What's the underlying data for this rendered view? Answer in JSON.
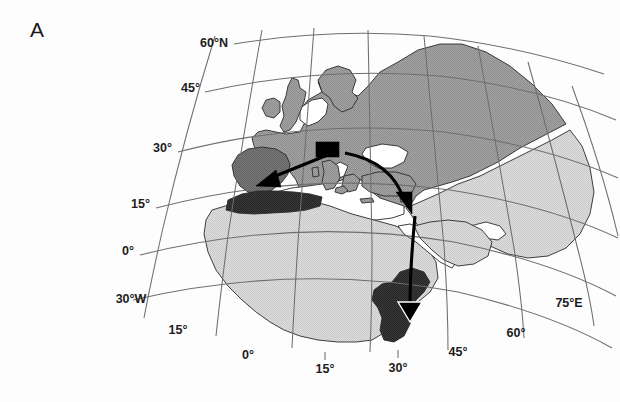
{
  "figure": {
    "panel_label": "A",
    "type": "map",
    "projection": "conic",
    "background_color": "#fdfdfd"
  },
  "colors": {
    "land_light": "#d6d6d6",
    "land_mid": "#9b9b9b",
    "land_highlight": "#6f6f6f",
    "land_dark": "#333333",
    "ocean": "#ffffff",
    "coastline": "#2a2a2a",
    "graticule": "#6e6e6e",
    "arrow": "#000000",
    "source_marker": "#000000",
    "text": "#1c1c1c"
  },
  "graticule": {
    "latitude_labels": [
      {
        "text": "60°N",
        "x": 228,
        "y": 47
      },
      {
        "text": "45°",
        "x": 196,
        "y": 92
      },
      {
        "text": "30°",
        "x": 160,
        "y": 152
      },
      {
        "text": "15°",
        "x": 135,
        "y": 208
      },
      {
        "text": "0°",
        "x": 119,
        "y": 253
      }
    ],
    "longitude_labels": [
      {
        "text": "30°W",
        "x": 120,
        "y": 299
      },
      {
        "text": "15°",
        "x": 172,
        "y": 330
      },
      {
        "text": "0°",
        "x": 245,
        "y": 355
      },
      {
        "text": "15°",
        "x": 318,
        "y": 369
      },
      {
        "text": "30°",
        "x": 392,
        "y": 368
      },
      {
        "text": "45°",
        "x": 455,
        "y": 352
      },
      {
        "text": "60°",
        "x": 513,
        "y": 333
      },
      {
        "text": "75°E",
        "x": 562,
        "y": 303
      }
    ]
  },
  "regions": [
    {
      "name": "eurasia-north",
      "shade": "land_mid",
      "description": "Northern Europe and western Russia, medium gray fill"
    },
    {
      "name": "asia-south",
      "shade": "land_light",
      "description": "Arabia, Iran, South Asia, light gray fill"
    },
    {
      "name": "africa",
      "shade": "land_light",
      "description": "African continent, light gray fill"
    },
    {
      "name": "iberia-highlight",
      "shade": "land_highlight",
      "description": "Iberian Peninsula, darker gray highlight"
    },
    {
      "name": "maghreb-dark",
      "shade": "land_dark",
      "description": "North African coastal band, near-black fill"
    },
    {
      "name": "horn-of-africa-dark",
      "shade": "land_dark",
      "description": "Horn of Africa / Ethiopia region, near-black fill"
    },
    {
      "name": "turkey-anatolia",
      "shade": "land_mid",
      "description": "Anatolia, medium gray fill"
    }
  ],
  "markers": [
    {
      "name": "source-marker",
      "shape": "filled-rectangle",
      "color": "#000000",
      "x": 316,
      "y": 142,
      "width": 23,
      "height": 15,
      "description": "Black rectangle over central Europe marking origin"
    }
  ],
  "arrows": [
    {
      "name": "arrow-to-iberia",
      "from_x": 330,
      "from_y": 152,
      "to_x": 262,
      "to_y": 182,
      "style": "straight-filled-head",
      "description": "Arrow from central Europe southwest into Iberia"
    },
    {
      "name": "arrow-to-levant",
      "from_x": 344,
      "from_y": 152,
      "to_x": 409,
      "to_y": 211,
      "style": "curved-filled-head",
      "description": "Curved arrow from central Europe southeast to the Levant"
    },
    {
      "name": "arrow-to-horn",
      "from_x": 415,
      "from_y": 217,
      "to_x": 411,
      "to_y": 321,
      "style": "straight-open-head",
      "description": "Long arrow running south to the Horn of Africa"
    }
  ]
}
